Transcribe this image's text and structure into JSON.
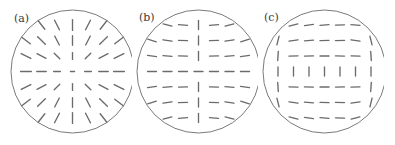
{
  "figure": {
    "type": "vector-field-director-plot",
    "background": "#ffffff",
    "stroke_color": "#6b6b6b",
    "circle_color": "#6b6b6b",
    "label_color": "#3a3a3a",
    "panel_count": 3
  },
  "panels": [
    {
      "id": "a",
      "label": "(a)",
      "label_x": 14,
      "label_y": 13,
      "circle": {
        "cx": 72.5,
        "cy": 71.5,
        "r": 61.5
      },
      "grid": {
        "rows": 7,
        "cols": 7,
        "spacing": 15.5,
        "origin_x": 26,
        "origin_y": 25
      },
      "segment_length": 9,
      "pattern": "radial-hedgehog",
      "description": "Radial director field: each segment is oriented along the line joining the grid point to the circle centre (a +1 hedgehog defect at the centre).",
      "angles_deg": [
        [
          225,
          232,
          243,
          270,
          297,
          308,
          315
        ],
        [
          218,
          225,
          243,
          270,
          297,
          315,
          322
        ],
        [
          207,
          207,
          225,
          270,
          315,
          333,
          333
        ],
        [
          180,
          180,
          180,
          0,
          0,
          0,
          0
        ],
        [
          153,
          153,
          135,
          90,
          45,
          27,
          27
        ],
        [
          142,
          135,
          117,
          90,
          63,
          45,
          38
        ],
        [
          135,
          128,
          117,
          90,
          63,
          52,
          45
        ]
      ]
    },
    {
      "id": "b",
      "label": "(b)",
      "label_x": 139,
      "label_y": 12,
      "circle": {
        "cx": 198.5,
        "cy": 71.5,
        "r": 61.5
      },
      "grid": {
        "rows": 7,
        "cols": 7,
        "spacing": 15.5,
        "origin_x": 152,
        "origin_y": 25
      },
      "segment_length": 9,
      "pattern": "two-defect-vertical-wall",
      "description": "Mostly horizontal director with a vertical column along the central axis; segments tilt toward the vertical wall near the top and bottom of the disc.",
      "angles_deg": [
        [
          28,
          14,
          4,
          90,
          176,
          166,
          152
        ],
        [
          18,
          9,
          2,
          90,
          178,
          171,
          162
        ],
        [
          8,
          4,
          1,
          90,
          179,
          176,
          172
        ],
        [
          0,
          0,
          0,
          0,
          0,
          0,
          0
        ],
        [
          172,
          176,
          179,
          90,
          1,
          4,
          8
        ],
        [
          162,
          171,
          178,
          90,
          2,
          9,
          18
        ],
        [
          152,
          166,
          176,
          90,
          4,
          14,
          28
        ]
      ]
    },
    {
      "id": "c",
      "label": "(c)",
      "label_x": 264,
      "label_y": 12,
      "circle": {
        "cx": 324.5,
        "cy": 71.5,
        "r": 61.5
      },
      "grid": {
        "rows": 7,
        "cols": 7,
        "spacing": 15.5,
        "origin_x": 278,
        "origin_y": 25
      },
      "segment_length": 9,
      "pattern": "two-defect-horizontal-wall",
      "description": "Panel (b) rotated by 90 degrees: mostly horizontal director with a horizontal row of vertical segments across the middle of the disc.",
      "angles_deg": [
        [
          118,
          166,
          172,
          176,
          178,
          184,
          62
        ],
        [
          104,
          171,
          176,
          178,
          179,
          189,
          76
        ],
        [
          94,
          178,
          179,
          180,
          181,
          182,
          86
        ],
        [
          90,
          90,
          90,
          90,
          90,
          90,
          90
        ],
        [
          86,
          2,
          1,
          0,
          359,
          358,
          94
        ],
        [
          76,
          9,
          4,
          2,
          1,
          351,
          104
        ],
        [
          62,
          14,
          8,
          4,
          2,
          346,
          118
        ]
      ]
    }
  ]
}
